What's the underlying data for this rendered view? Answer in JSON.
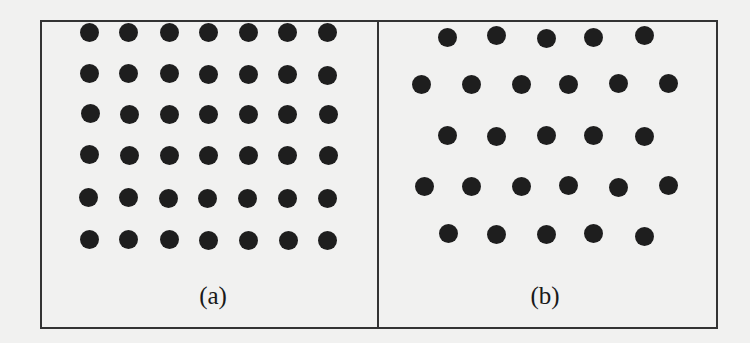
{
  "figure": {
    "background": "#f1f1f0",
    "frame_color": "#333333",
    "dot_color": "#1e1e1e",
    "dot_diameter": 19,
    "panels": [
      {
        "id": "a",
        "label": "(a)",
        "lattice": "square",
        "columns": 7,
        "rows": 6,
        "label_pos": [
          213,
          298
        ],
        "dots": [
          [
            89,
            32
          ],
          [
            128,
            32
          ],
          [
            169,
            32
          ],
          [
            208,
            32
          ],
          [
            248,
            32
          ],
          [
            287,
            32
          ],
          [
            327,
            32
          ],
          [
            89,
            73
          ],
          [
            128,
            73
          ],
          [
            169,
            73
          ],
          [
            208,
            74
          ],
          [
            248,
            74
          ],
          [
            287,
            74
          ],
          [
            327,
            75
          ],
          [
            90,
            113
          ],
          [
            129,
            114
          ],
          [
            169,
            114
          ],
          [
            208,
            114
          ],
          [
            248,
            114
          ],
          [
            287,
            114
          ],
          [
            328,
            114
          ],
          [
            89,
            154
          ],
          [
            129,
            155
          ],
          [
            169,
            155
          ],
          [
            208,
            155
          ],
          [
            248,
            155
          ],
          [
            287,
            155
          ],
          [
            328,
            155
          ],
          [
            88,
            197
          ],
          [
            128,
            197
          ],
          [
            168,
            198
          ],
          [
            207,
            198
          ],
          [
            247,
            198
          ],
          [
            287,
            198
          ],
          [
            327,
            198
          ],
          [
            89,
            239
          ],
          [
            128,
            239
          ],
          [
            169,
            239
          ],
          [
            208,
            240
          ],
          [
            248,
            240
          ],
          [
            288,
            240
          ],
          [
            327,
            240
          ]
        ]
      },
      {
        "id": "b",
        "label": "(b)",
        "lattice": "hexagonal",
        "rows": 5,
        "row_counts": [
          5,
          6,
          5,
          6,
          5
        ],
        "label_pos": [
          545,
          298
        ],
        "dots": [
          [
            447,
            37
          ],
          [
            496,
            35
          ],
          [
            546,
            38
          ],
          [
            593,
            37
          ],
          [
            644,
            35
          ],
          [
            421,
            84
          ],
          [
            471,
            84
          ],
          [
            521,
            84
          ],
          [
            568,
            84
          ],
          [
            618,
            83
          ],
          [
            668,
            83
          ],
          [
            447,
            135
          ],
          [
            496,
            136
          ],
          [
            546,
            135
          ],
          [
            593,
            135
          ],
          [
            644,
            136
          ],
          [
            424,
            186
          ],
          [
            471,
            186
          ],
          [
            521,
            186
          ],
          [
            568,
            185
          ],
          [
            618,
            187
          ],
          [
            668,
            185
          ],
          [
            448,
            233
          ],
          [
            496,
            234
          ],
          [
            546,
            234
          ],
          [
            593,
            233
          ],
          [
            644,
            236
          ]
        ]
      }
    ]
  }
}
